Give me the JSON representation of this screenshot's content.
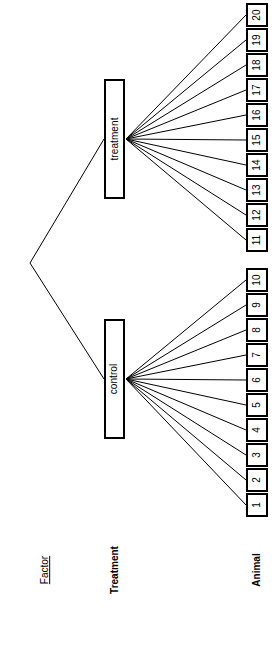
{
  "diagram": {
    "type": "hierarchical-tree",
    "orientation": "rotated-90-ccw",
    "root": {
      "name": "root-fork",
      "x": 30,
      "y": 263
    },
    "levels": [
      {
        "id": "factor",
        "legend_label": "Factor",
        "legend_style": "underline"
      },
      {
        "id": "treatment",
        "legend_label": "Treatment",
        "legend_style": "bold"
      },
      {
        "id": "animal",
        "legend_label": "Animal",
        "legend_style": "bold"
      }
    ],
    "groups": [
      {
        "id": "treatment-group",
        "label": "treatment",
        "x": 104,
        "y": 79,
        "height": 120,
        "anchor_x": 126,
        "anchor_y": 139,
        "leaves": [
          "11",
          "12",
          "13",
          "14",
          "15",
          "16",
          "17",
          "18",
          "19",
          "20"
        ]
      },
      {
        "id": "control-group",
        "label": "control",
        "x": 104,
        "y": 319,
        "height": 120,
        "anchor_x": 126,
        "anchor_y": 379,
        "leaves": [
          "1",
          "2",
          "3",
          "4",
          "5",
          "6",
          "7",
          "8",
          "9",
          "10"
        ]
      }
    ],
    "leaves": [
      {
        "label": "20",
        "y": 3,
        "group": "treatment-group"
      },
      {
        "label": "19",
        "y": 28,
        "group": "treatment-group"
      },
      {
        "label": "18",
        "y": 53,
        "group": "treatment-group"
      },
      {
        "label": "17",
        "y": 78,
        "group": "treatment-group"
      },
      {
        "label": "16",
        "y": 103,
        "group": "treatment-group"
      },
      {
        "label": "15",
        "y": 128,
        "group": "treatment-group"
      },
      {
        "label": "14",
        "y": 153,
        "group": "treatment-group"
      },
      {
        "label": "13",
        "y": 178,
        "group": "treatment-group"
      },
      {
        "label": "12",
        "y": 203,
        "group": "treatment-group"
      },
      {
        "label": "11",
        "y": 228,
        "group": "treatment-group"
      },
      {
        "label": "10",
        "y": 268,
        "group": "control-group"
      },
      {
        "label": "9",
        "y": 293,
        "group": "control-group"
      },
      {
        "label": "8",
        "y": 318,
        "group": "control-group"
      },
      {
        "label": "7",
        "y": 343,
        "group": "control-group"
      },
      {
        "label": "6",
        "y": 368,
        "group": "control-group"
      },
      {
        "label": "5",
        "y": 393,
        "group": "control-group"
      },
      {
        "label": "4",
        "y": 418,
        "group": "control-group"
      },
      {
        "label": "3",
        "y": 443,
        "group": "control-group"
      },
      {
        "label": "2",
        "y": 468,
        "group": "control-group"
      },
      {
        "label": "1",
        "y": 493,
        "group": "control-group"
      }
    ],
    "legend": {
      "factor": {
        "label": "Factor",
        "x": 5,
        "y": 562
      },
      "treatment": {
        "label": "Treatment",
        "x": 75,
        "y": 562
      },
      "animal": {
        "label": "Animal",
        "x": 217,
        "y": 562
      }
    },
    "colors": {
      "stroke": "#000000",
      "fill": "#ffffff",
      "text": "#000000"
    }
  }
}
